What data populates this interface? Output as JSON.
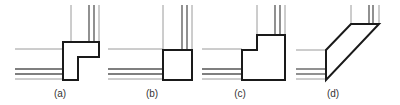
{
  "figure": {
    "panels": [
      {
        "id": "a",
        "label": "(a)",
        "shape": "L-shaped corner piece"
      },
      {
        "id": "b",
        "label": "(b)",
        "shape": "square corner piece"
      },
      {
        "id": "c",
        "label": "(c)",
        "shape": "stepped corner piece"
      },
      {
        "id": "d",
        "label": "(d)",
        "shape": "diagonal parallelogram corner piece"
      }
    ],
    "colors": {
      "outline": "#1a1a1a",
      "thin_line": "#9a9a9a",
      "double_line": "#555555",
      "background": "#ffffff"
    }
  }
}
